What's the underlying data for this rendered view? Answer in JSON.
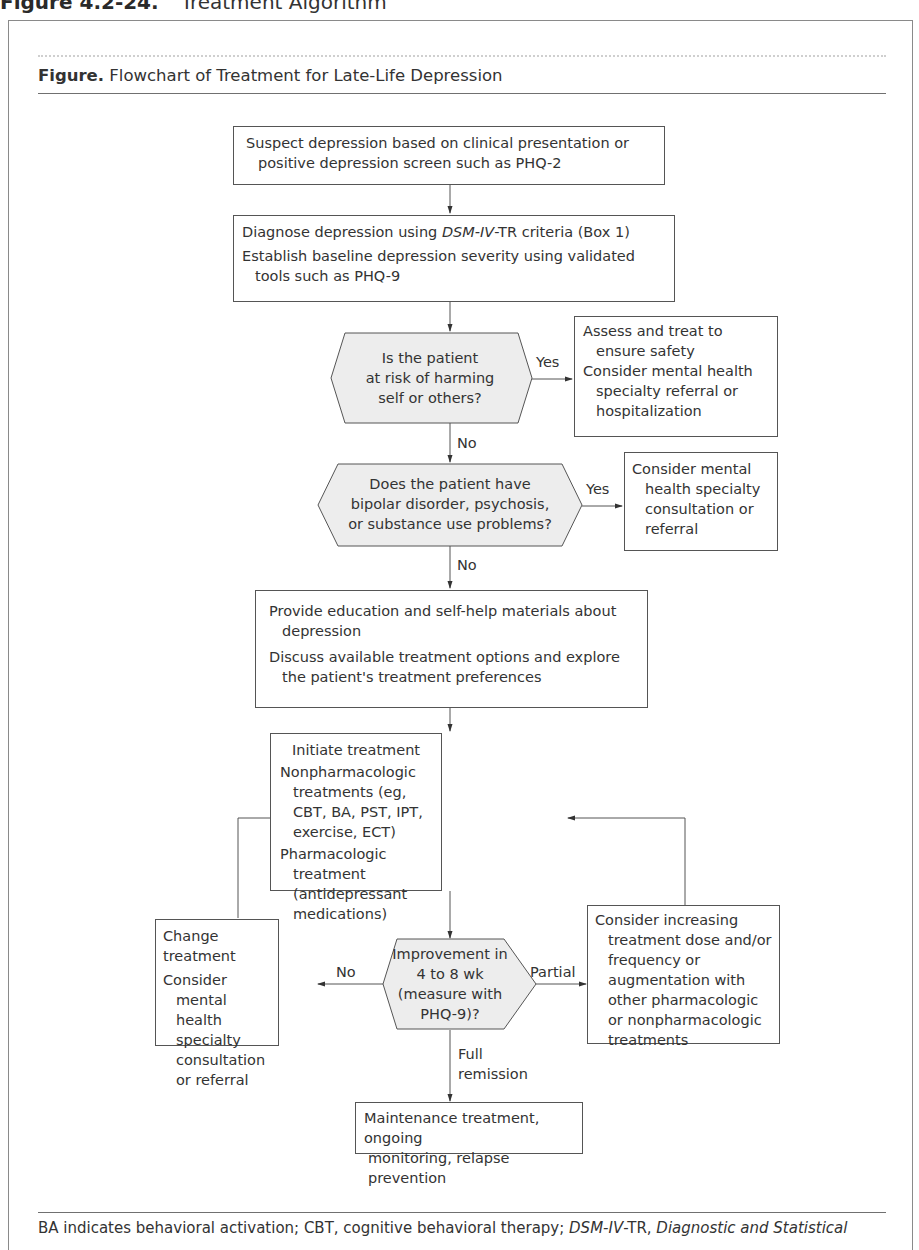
{
  "page_heading": {
    "number": "Figure 4.2-24.",
    "title": "Treatment Algorithm"
  },
  "figure": {
    "label": "Figure.",
    "title": "Flowchart of Treatment for Late-Life Depression"
  },
  "nodes": {
    "suspect": {
      "lines": [
        "Suspect depression based on clinical presentation or",
        "positive depression screen such as PHQ-2"
      ]
    },
    "diagnose": {
      "line1_pre": "Diagnose depression using ",
      "line1_italic": "DSM-IV",
      "line1_post": "-TR criteria (Box 1)",
      "line2": "Establish baseline depression severity using validated tools such as PHQ-9"
    },
    "risk_question": {
      "lines": [
        "Is the patient",
        "at risk of harming",
        "self or others?"
      ]
    },
    "safety_action": {
      "item1": "Assess and treat to ensure safety",
      "item2": "Consider mental health specialty referral or hospitalization"
    },
    "bipolar_question": {
      "lines": [
        "Does the patient have",
        "bipolar disorder, psychosis,",
        "or substance use problems?"
      ]
    },
    "specialty_consult": {
      "text": "Consider mental health specialty consultation or referral"
    },
    "education": {
      "item1": "Provide education and self-help materials about depression",
      "item2": "Discuss available treatment options and explore the patient's treatment preferences"
    },
    "initiate": {
      "heading": "Initiate treatment",
      "item1": "Nonpharmacologic treatments (eg, CBT, BA, PST, IPT, exercise, ECT)",
      "item2": "Pharmacologic treatment (antidepressant medications)"
    },
    "improvement_question": {
      "lines": [
        "Improvement in",
        "4 to 8 wk",
        "(measure with",
        "PHQ-9)?"
      ]
    },
    "change_treatment": {
      "item1": "Change treatment",
      "item2": "Consider mental health specialty consultation or referral"
    },
    "increase_treatment": {
      "text": "Consider increasing treatment dose and/or frequency or augmentation with other pharmacologic or nonpharmacologic treatments"
    },
    "maintenance": {
      "lines": [
        "Maintenance treatment, ongoing",
        "monitoring, relapse prevention"
      ]
    }
  },
  "edge_labels": {
    "risk_yes": "Yes",
    "risk_no": "No",
    "bipolar_yes": "Yes",
    "bipolar_no": "No",
    "improve_no": "No",
    "improve_partial": "Partial",
    "improve_full_1": "Full",
    "improve_full_2": "remission"
  },
  "footnote": {
    "pre": "BA indicates behavioral activation; CBT, cognitive behavioral therapy; ",
    "italic1": "DSM-IV",
    "mid": "-TR, ",
    "italic2": "Diagnostic and Statistical"
  },
  "colors": {
    "line": "#555555",
    "decision_fill": "#ededed",
    "frame": "#8a8a8a"
  }
}
